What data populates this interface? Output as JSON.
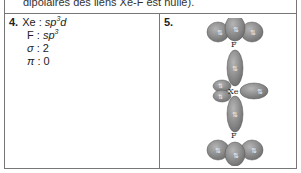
{
  "top_text": "dipolaires des liens Xe-F est nulle).",
  "cells": [
    {
      "number": "4.",
      "lines": [
        {
          "label": "Xe",
          "sep": " : ",
          "value_base": "sp",
          "value_sup": "3",
          "value_tail": "d"
        },
        {
          "label": "F",
          "sep": " : ",
          "value_base": "sp",
          "value_sup": "3",
          "value_tail": ""
        },
        {
          "label": "σ",
          "sep": " : ",
          "value": "2"
        },
        {
          "label": "π",
          "sep": " : ",
          "value": "0"
        }
      ]
    },
    {
      "number": "5.",
      "figure": {
        "description": "Orbital diagram of XeF2 molecule",
        "atoms": {
          "top": "F",
          "center": "Xe",
          "bottom": "F"
        },
        "electron_pair_symbol": "⇅",
        "lobe_color": "#8a8a8a"
      }
    }
  ]
}
